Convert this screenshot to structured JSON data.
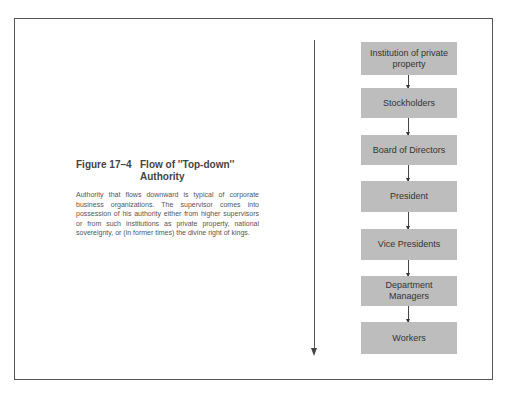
{
  "figure": {
    "number": "Figure 17–4",
    "title_line1": "Flow of ''Top-down''",
    "title_line2": "Authority",
    "caption": "Authority that flows downward is typical of corporate business organizations. The supervisor comes into possession of his authority either from higher supervisors or from such institutions as private property, national sovereignty, or (in former times) the divine right of kings."
  },
  "diagram": {
    "type": "vertical-flowchart",
    "direction": "top-down",
    "nodes": [
      {
        "label": "Institution of private property"
      },
      {
        "label": "Stockholders"
      },
      {
        "label": "Board of Directors"
      },
      {
        "label": "President"
      },
      {
        "label": "Vice Presidents"
      },
      {
        "label": "Department Managers"
      },
      {
        "label": "Workers"
      }
    ],
    "box_color": "#bdbdbd",
    "arrow_color": "#444444"
  }
}
